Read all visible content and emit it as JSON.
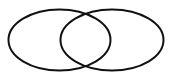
{
  "diagram": {
    "type": "venn",
    "background": "#ffffff",
    "stroke_color": "#111111",
    "stroke_width": 2,
    "sets": [
      {
        "name": "left-set",
        "cx": 59.5,
        "cy": 40,
        "rx": 51,
        "ry": 30.5
      },
      {
        "name": "right-set",
        "cx": 112,
        "cy": 40,
        "rx": 51.5,
        "ry": 30.5
      }
    ]
  }
}
